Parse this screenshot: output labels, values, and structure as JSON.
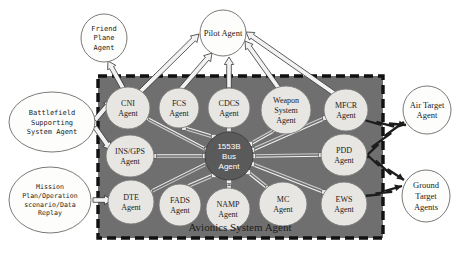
{
  "diagram": {
    "title_label": "Avionics System Agent",
    "colors": {
      "container_fill": "#6f6f6f",
      "container_border": "#111111",
      "node_fill": "#e8e6e2",
      "node_border": "#7a7a7a",
      "hub_fill": "#5a5a5a",
      "hub_text": "#ffffff",
      "external_fill": "#fdfdfb",
      "external_border": "#6a6a6a",
      "arrow_fill": "#f2f2f2",
      "arrow_stroke": "#2a2a2a",
      "text": "#1b1b1b",
      "page_background": "#ffffff"
    },
    "container": {
      "name": "avionics-system-agent-box",
      "x": 98,
      "y": 76,
      "width": 285,
      "height": 162,
      "border_style": "dashed"
    },
    "external_nodes": [
      {
        "id": "friend-plane-agent",
        "lines": [
          "Friend",
          "Plane",
          "Agent"
        ],
        "cx": 104,
        "cy": 38,
        "rx": 23,
        "ry": 24,
        "font": "mono",
        "size": 7
      },
      {
        "id": "pilot-agent",
        "lines": [
          "Pilot Agent"
        ],
        "cx": 223,
        "cy": 33,
        "rx": 23,
        "ry": 23,
        "font": "serif",
        "size": 8.5
      },
      {
        "id": "battlefield-supporting-system-agent",
        "lines": [
          "Battlefield",
          "Supporting",
          "System Agent"
        ],
        "cx": 52,
        "cy": 122,
        "rx": 43,
        "ry": 30,
        "font": "mono",
        "size": 7
      },
      {
        "id": "mission-plan-operation-scenario-data-replay",
        "lines": [
          "Mission",
          "Plan/Operation",
          "scenario/Data",
          "Replay"
        ],
        "cx": 50,
        "cy": 200,
        "rx": 41,
        "ry": 33,
        "font": "mono",
        "size": 6.6
      },
      {
        "id": "air-target-agent",
        "lines": [
          "Air Target",
          "Agent"
        ],
        "cx": 427,
        "cy": 110,
        "rx": 24,
        "ry": 24,
        "font": "serif",
        "size": 8.5
      },
      {
        "id": "ground-target-agents",
        "lines": [
          "Ground",
          "Target",
          "Agents"
        ],
        "cx": 426,
        "cy": 196,
        "rx": 24,
        "ry": 26,
        "font": "serif",
        "size": 8.5
      }
    ],
    "internal_nodes": [
      {
        "id": "cni-agent",
        "lines": [
          "CNI",
          "Agent"
        ],
        "cx": 128,
        "cy": 108,
        "rx": 22,
        "ry": 21,
        "size": 8
      },
      {
        "id": "fcs-agent",
        "lines": [
          "FCS",
          "Agent"
        ],
        "cx": 179,
        "cy": 108,
        "rx": 20,
        "ry": 20,
        "size": 8
      },
      {
        "id": "cdcs-agent",
        "lines": [
          "CDCS",
          "Agent"
        ],
        "cx": 229,
        "cy": 108,
        "rx": 21,
        "ry": 20,
        "size": 8
      },
      {
        "id": "weapon-system-agent",
        "lines": [
          "Weapon",
          "System",
          "Agent"
        ],
        "cx": 286,
        "cy": 110,
        "rx": 25,
        "ry": 24,
        "size": 8
      },
      {
        "id": "mfcr-agent",
        "lines": [
          "MFCR",
          "Agent"
        ],
        "cx": 346,
        "cy": 110,
        "rx": 22,
        "ry": 21,
        "size": 8
      },
      {
        "id": "ins-gps-agent",
        "lines": [
          "INS/GPS",
          "Agent"
        ],
        "cx": 130,
        "cy": 156,
        "rx": 24,
        "ry": 21,
        "size": 8
      },
      {
        "id": "pdd-agent",
        "lines": [
          "PDD",
          "Agent"
        ],
        "cx": 344,
        "cy": 155,
        "rx": 23,
        "ry": 21,
        "size": 8
      },
      {
        "id": "dte-agent",
        "lines": [
          "DTE",
          "Agent"
        ],
        "cx": 131,
        "cy": 202,
        "rx": 23,
        "ry": 22,
        "size": 8
      },
      {
        "id": "fads-agent",
        "lines": [
          "FADS",
          "Agent"
        ],
        "cx": 180,
        "cy": 205,
        "rx": 21,
        "ry": 21,
        "size": 8
      },
      {
        "id": "namp-agent",
        "lines": [
          "NAMP",
          "Agent"
        ],
        "cx": 228,
        "cy": 209,
        "rx": 22,
        "ry": 21,
        "size": 8
      },
      {
        "id": "mc-agent",
        "lines": [
          "MC",
          "Agent"
        ],
        "cx": 283,
        "cy": 204,
        "rx": 24,
        "ry": 22,
        "size": 8
      },
      {
        "id": "ews-agent",
        "lines": [
          "EWS",
          "Agent"
        ],
        "cx": 344,
        "cy": 204,
        "rx": 23,
        "ry": 22,
        "size": 8
      }
    ],
    "hub_node": {
      "id": "1553b-bus-agent",
      "lines": [
        "1553B",
        "Bus",
        "Agent"
      ],
      "cx": 229,
      "cy": 156,
      "rx": 24,
      "ry": 24,
      "size": 8
    },
    "box_title": {
      "x": 240,
      "y": 231,
      "size": 11
    },
    "block_arrows": [
      {
        "id": "cni-to-friend-plane",
        "x1": 124,
        "y1": 90,
        "x2": 108,
        "y2": 61
      },
      {
        "id": "cni-to-pilot",
        "x1": 134,
        "y1": 98,
        "x2": 199,
        "y2": 34
      },
      {
        "id": "fcs-to-pilot",
        "x1": 180,
        "y1": 90,
        "x2": 212,
        "y2": 53
      },
      {
        "id": "cdcs-to-pilot",
        "x1": 229,
        "y1": 88,
        "x2": 229,
        "y2": 57
      },
      {
        "id": "weapon-to-pilot",
        "x1": 280,
        "y1": 90,
        "x2": 245,
        "y2": 41
      },
      {
        "id": "mfcr-to-pilot",
        "x1": 335,
        "y1": 94,
        "x2": 246,
        "y2": 32
      },
      {
        "id": "battlefield-to-cni",
        "x1": 95,
        "y1": 120,
        "x2": 112,
        "y2": 100
      },
      {
        "id": "battlefield-to-ins-gps",
        "x1": 95,
        "y1": 127,
        "x2": 111,
        "y2": 150
      },
      {
        "id": "mission-to-dte",
        "x1": 93,
        "y1": 200,
        "x2": 112,
        "y2": 200
      }
    ],
    "lightning_arrows": [
      {
        "id": "mfcr-to-air-target",
        "x1": 364,
        "y1": 120,
        "x2": 406,
        "y2": 125
      },
      {
        "id": "air-target-to-sensors",
        "x1": 404,
        "y1": 122,
        "x2": 362,
        "y2": 160
      },
      {
        "id": "pdd-to-ground-target",
        "x1": 364,
        "y1": 152,
        "x2": 404,
        "y2": 180
      },
      {
        "id": "ews-to-ground-target",
        "x1": 364,
        "y1": 196,
        "x2": 402,
        "y2": 186
      }
    ],
    "bus_links": [
      {
        "id": "link-bus-cdcs",
        "x1": 229,
        "y1": 131,
        "x2": 229,
        "y2": 129
      },
      {
        "id": "link-bus-namp",
        "x1": 229,
        "y1": 181,
        "x2": 229,
        "y2": 188
      },
      {
        "id": "link-bus-cni",
        "x1": 207,
        "y1": 150,
        "x2": 146,
        "y2": 118
      },
      {
        "id": "link-bus-ins-gps",
        "x1": 205,
        "y1": 156,
        "x2": 154,
        "y2": 156
      },
      {
        "id": "link-bus-dte",
        "x1": 208,
        "y1": 163,
        "x2": 150,
        "y2": 192
      },
      {
        "id": "link-bus-fcs",
        "x1": 214,
        "y1": 137,
        "x2": 184,
        "y2": 128
      },
      {
        "id": "link-bus-fads",
        "x1": 214,
        "y1": 175,
        "x2": 186,
        "y2": 187
      },
      {
        "id": "link-bus-weapon",
        "x1": 250,
        "y1": 144,
        "x2": 275,
        "y2": 130
      },
      {
        "id": "link-bus-mfcr",
        "x1": 252,
        "y1": 150,
        "x2": 325,
        "y2": 118
      },
      {
        "id": "link-bus-pdd",
        "x1": 253,
        "y1": 156,
        "x2": 321,
        "y2": 155
      },
      {
        "id": "link-bus-ews",
        "x1": 252,
        "y1": 164,
        "x2": 324,
        "y2": 192
      },
      {
        "id": "link-bus-mc",
        "x1": 248,
        "y1": 172,
        "x2": 268,
        "y2": 188
      }
    ]
  }
}
